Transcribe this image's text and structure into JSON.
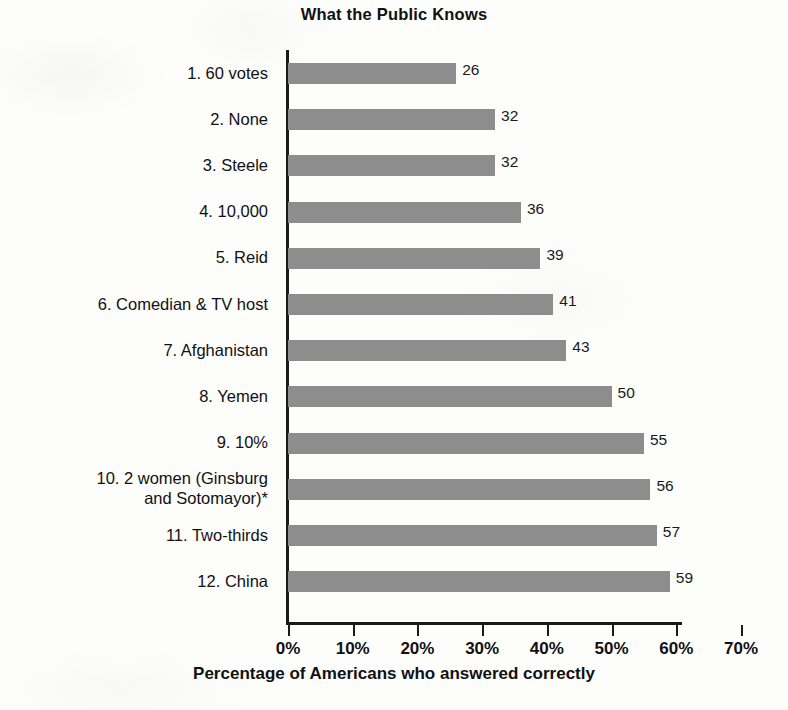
{
  "chart_data": {
    "type": "bar",
    "orientation": "horizontal",
    "title": "What the Public Knows",
    "xlabel": "Percentage of Americans who answered correctly",
    "ylabel": "",
    "xlim": [
      0,
      70
    ],
    "grid": false,
    "legend": null,
    "tick_labels": [
      "0%",
      "10%",
      "20%",
      "30%",
      "40%",
      "50%",
      "60%",
      "70%"
    ],
    "tick_values": [
      0,
      10,
      20,
      30,
      40,
      50,
      60,
      70
    ],
    "categories": [
      "1. 60 votes",
      "2. None",
      "3. Steele",
      "4. 10,000",
      "5. Reid",
      "6. Comedian & TV host",
      "7. Afghanistan",
      "8. Yemen",
      "9. 10%",
      "10. 2 women (Ginsburg\nand Sotomayor)*",
      "11. Two-thirds",
      "12. China"
    ],
    "values": [
      26,
      32,
      32,
      36,
      39,
      41,
      43,
      50,
      55,
      56,
      57,
      59
    ],
    "data_labels": [
      "26",
      "32",
      "32",
      "36",
      "39",
      "41",
      "43",
      "50",
      "55",
      "56",
      "57",
      "59"
    ],
    "bar_color": "#8d8d8d",
    "axis_color": "#1a1a1a",
    "background_color": "#fdfdfc"
  }
}
